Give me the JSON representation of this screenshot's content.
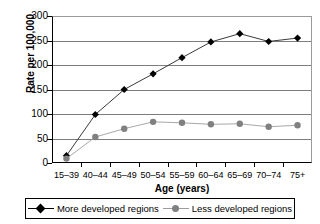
{
  "chart_data": {
    "type": "line",
    "title": "",
    "xlabel": "Age (years)",
    "ylabel": "Rate per 100,000",
    "categories": [
      "15–39",
      "40–44",
      "45–49",
      "50–54",
      "55–59",
      "60–64",
      "65–69",
      "70–74",
      "75+"
    ],
    "ylim": [
      0,
      300
    ],
    "yticks": [
      0,
      50,
      100,
      150,
      200,
      250,
      300
    ],
    "ytick_labels": [
      "0",
      "50",
      "100",
      "150",
      "200",
      "250",
      "300"
    ],
    "grid": true,
    "legend_position": "bottom",
    "series": [
      {
        "name": "More developed regions",
        "marker": "diamond",
        "color": "#000000",
        "values": [
          15,
          99,
          150,
          182,
          215,
          247,
          264,
          248,
          255
        ]
      },
      {
        "name": "Less developed regions",
        "marker": "circle",
        "color": "#808080",
        "values": [
          9,
          53,
          70,
          84,
          82,
          79,
          80,
          74,
          77
        ]
      }
    ]
  },
  "legend": {
    "entries": [
      {
        "label": "More developed regions"
      },
      {
        "label": "Less developed regions"
      }
    ]
  },
  "colors": {
    "more_developed": "#000000",
    "less_developed": "#808080",
    "gridline": "#7d7d7d",
    "axis": "#000000",
    "background": "#ffffff"
  }
}
